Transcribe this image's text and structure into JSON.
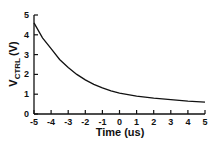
{
  "chart_data": {
    "type": "line",
    "title": "",
    "xlabel": "Time (us)",
    "ylabel": "V_CTRL (V)",
    "ylabel_main": "V",
    "ylabel_sub": "CTRL",
    "ylabel_unit": "(V)",
    "xlim": [
      -5,
      5
    ],
    "ylim": [
      0,
      5
    ],
    "grid": false,
    "legend": null,
    "x_ticks": [
      "-5",
      "-4",
      "-3",
      "-2",
      "-1",
      "0",
      "1",
      "2",
      "3",
      "4",
      "5"
    ],
    "y_ticks": [
      "0",
      "1",
      "2",
      "3",
      "4",
      "5"
    ],
    "series": [
      {
        "name": "V_CTRL",
        "color": "#111111",
        "x": [
          -5,
          -4.5,
          -4,
          -3.5,
          -3,
          -2.5,
          -2,
          -1.5,
          -1,
          -0.5,
          0,
          1,
          2,
          3,
          4,
          5
        ],
        "values": [
          4.6,
          3.85,
          3.3,
          2.75,
          2.35,
          2.0,
          1.72,
          1.5,
          1.32,
          1.17,
          1.05,
          0.9,
          0.8,
          0.72,
          0.65,
          0.6
        ]
      }
    ]
  }
}
